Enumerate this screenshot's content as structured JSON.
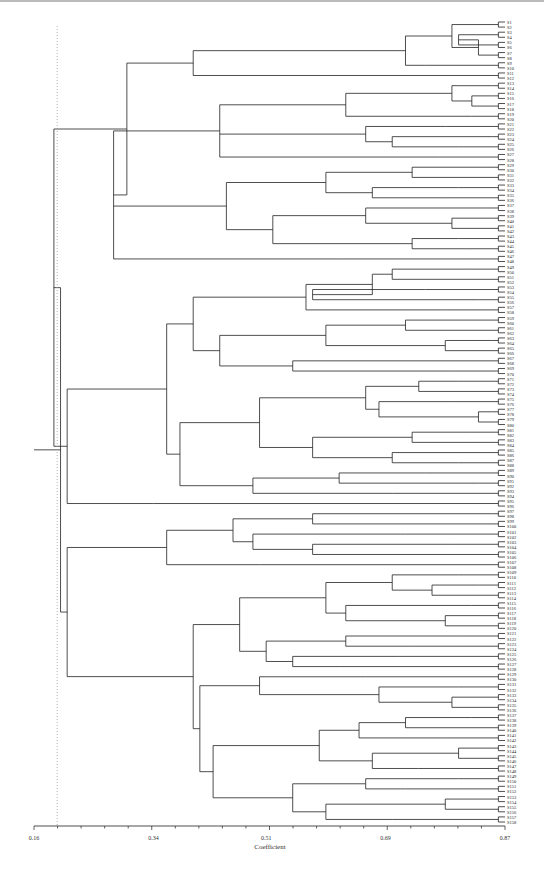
{
  "chart_data": {
    "type": "dendrogram",
    "title": "",
    "xlabel": "Coefficient",
    "ylabel": "",
    "xlim": [
      0.16,
      0.87
    ],
    "x_ticks": [
      "0.16",
      "0.34",
      "0.51",
      "0.69",
      "0.87"
    ],
    "x_tick_values": [
      0.16,
      0.34,
      0.51,
      0.69,
      0.87
    ],
    "cutoff_line": 0.195,
    "leaf_count": 180,
    "leaf_label_prefix": "S",
    "tree": [
      0.2,
      [
        0.19,
        [
          0.3,
          [
            0.4,
            [
              0.72,
              [
                0.79,
                [
                  0.84,
                  2
                ],
                [
                  0.83,
                  [
                    0.8,
                    [
                      0.86,
                      2
                    ],
                    2
                  ],
                  [
                    0.84,
                    2
                  ]
                ]
              ],
              [
                0.75,
                2
              ]
            ],
            [
              0.6,
              2
            ]
          ],
          [
            0.28,
            [
              0.44,
              [
                0.63,
                [
                  0.79,
                  [
                    0.85,
                    2
                  ],
                  [
                    0.82,
                    [
                      0.85,
                      2
                    ],
                    2
                  ]
                ],
                [
                  0.82,
                  2
                ]
              ],
              [
                0.66,
                [
                  0.78,
                  2
                ],
                [
                  0.7,
                  [
                    0.85,
                    2
                  ],
                  [
                    0.8,
                    2
                  ]
                ]
              ],
              [
                0.77,
                2
              ]
            ],
            [
              0.45,
              [
                0.6,
                [
                  0.73,
                  [
                    0.84,
                    2
                  ],
                  2
                ],
                [
                  0.67,
                  [
                    0.8,
                    2
                  ],
                  [
                    0.78,
                    2
                  ]
                ]
              ],
              [
                0.52,
                [
                  0.66,
                  [
                    0.84,
                    2
                  ],
                  [
                    0.79,
                    [
                      0.85,
                      2
                    ],
                    2
                  ]
                ],
                [
                  0.73,
                  [
                    0.8,
                    2
                  ],
                  [
                    0.81,
                    2
                  ]
                ]
              ]
            ],
            [
              0.62,
              2
            ]
          ]
        ],
        [
          0.21,
          [
            0.36,
            [
              0.4,
              [
                0.57,
                [
                  0.67,
                  [
                    0.7,
                    [
                      0.81,
                      2
                    ],
                    [
                      0.76,
                      2
                    ]
                  ],
                  [
                    0.58,
                    [
                      0.75,
                      2
                    ],
                    [
                      0.83,
                      2
                    ]
                  ]
                ],
                [
                  0.78,
                  2
                ]
              ],
              [
                0.44,
                [
                  0.6,
                  [
                    0.72,
                    [
                      0.84,
                      2
                    ],
                    2
                  ],
                  [
                    0.78,
                    [
                      0.85,
                      2
                    ],
                    2
                  ]
                ],
                [
                  0.55,
                  [
                    0.71,
                    2
                  ],
                  [
                    0.79,
                    2
                  ]
                ]
              ]
            ],
            [
              0.38,
              [
                0.5,
                [
                  0.66,
                  [
                    0.74,
                    [
                      0.8,
                      2
                    ],
                    [
                      0.84,
                      2
                    ]
                  ],
                  [
                    0.68,
                    [
                      0.79,
                      2
                    ],
                    [
                      0.83,
                      [
                        0.85,
                        2
                      ],
                      2
                    ]
                  ]
                ],
                [
                  0.58,
                  [
                    0.73,
                    [
                      0.82,
                      2
                    ],
                    2
                  ],
                  [
                    0.7,
                    [
                      0.84,
                      2
                    ],
                    [
                      0.8,
                      2
                    ]
                  ]
                ]
              ],
              [
                0.49,
                [
                  0.62,
                  [
                    0.75,
                    2
                  ],
                  [
                    0.83,
                    2
                  ]
                ],
                [
                  0.7,
                  2
                ]
              ]
            ]
          ],
          [
            0.34,
            2
          ]
        ]
      ],
      [
        0.21,
        [
          0.36,
          [
            0.46,
            [
              0.58,
              [
                0.85,
                2
              ],
              [
                0.85,
                2
              ]
            ],
            [
              0.49,
              [
                0.72,
                2
              ],
              [
                0.58,
                [
                  0.79,
                  2
                ],
                2
              ]
            ]
          ],
          [
            0.5,
            2
          ]
        ],
        [
          0.4,
          [
            0.47,
            [
              0.6,
              [
                0.7,
                [
                  0.8,
                  2
                ],
                [
                  0.76,
                  [
                    0.83,
                    2
                  ],
                  2
                ]
              ],
              [
                0.63,
                [
                  0.82,
                  2
                ],
                [
                  0.78,
                  [
                    0.86,
                    2
                  ],
                  2
                ]
              ]
            ],
            [
              0.51,
              [
                0.63,
                [
                  0.8,
                  2
                ],
                [
                  0.73,
                  2
                ]
              ],
              [
                0.55,
                [
                  0.71,
                  2
                ],
                [
                  0.62,
                  2
                ]
              ]
            ]
          ],
          [
            0.41,
            [
              0.5,
              [
                0.66,
                2
              ],
              [
                0.68,
                [
                  0.8,
                  2
                ],
                [
                  0.79,
                  [
                    0.86,
                    2
                  ],
                  2
                ]
              ]
            ],
            [
              0.43,
              [
                0.59,
                [
                  0.65,
                  [
                    0.72,
                    [
                      0.82,
                      2
                    ],
                    2
                  ],
                  [
                    0.78,
                    2
                  ]
                ],
                [
                  0.67,
                  [
                    0.8,
                    [
                      0.85,
                      2
                    ],
                    2
                  ],
                  [
                    0.74,
                    2
                  ]
                ]
              ],
              [
                0.55,
                [
                  0.66,
                  [
                    0.8,
                    2
                  ],
                  [
                    0.72,
                    2
                  ]
                ],
                [
                  0.6,
                  [
                    0.78,
                    [
                      0.84,
                      2
                    ],
                    2
                  ],
                  [
                    0.7,
                    2
                  ]
                ]
              ]
            ]
          ]
        ]
      ]
    ]
  }
}
